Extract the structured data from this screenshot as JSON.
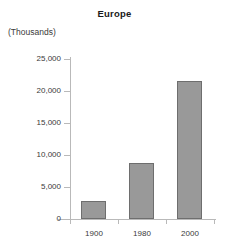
{
  "chart_data": {
    "type": "bar",
    "title": "Europe",
    "unit_label": "(Thousands)",
    "xlabel": "",
    "ylabel": "",
    "categories": [
      "1900",
      "1980",
      "2000"
    ],
    "values": [
      2800,
      8700,
      21500
    ],
    "ytick_labels": [
      "0",
      "5,000",
      "10,000",
      "15,000",
      "20,000",
      "25,000"
    ],
    "ytick_values": [
      0,
      5000,
      10000,
      15000,
      20000,
      25000
    ],
    "ylim": [
      0,
      25000
    ],
    "grid": false,
    "legend": null,
    "series_color": "#999999",
    "series_border_color": "#6e6e6e",
    "axis_color": "#b9b9b9",
    "text_color": "#3a3a3a"
  }
}
